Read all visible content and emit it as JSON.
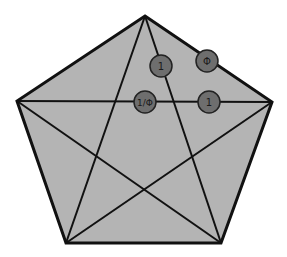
{
  "diagram": {
    "colors": {
      "background": "#ffffff",
      "pentagon_fill": "#b4b4b4",
      "stroke": "#111111",
      "label_circle_fill": "#6e6e6e",
      "label_text": "#1a1a1a"
    },
    "labels": [
      {
        "id": "label-1-upper",
        "text": "1",
        "cx": 161,
        "cy": 66
      },
      {
        "id": "label-phi",
        "text": "Φ",
        "cx": 207,
        "cy": 61
      },
      {
        "id": "label-inv-phi",
        "text": "1/Φ",
        "cx": 145,
        "cy": 102
      },
      {
        "id": "label-1-right",
        "text": "1",
        "cx": 209,
        "cy": 102
      }
    ]
  }
}
